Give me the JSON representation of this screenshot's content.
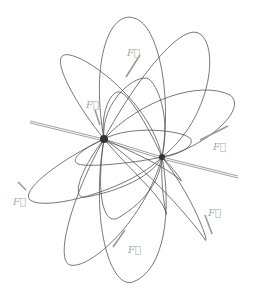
{
  "diagram": {
    "title": "",
    "colors": {
      "field_line": "#555555",
      "force_vector": "#9a9a9a",
      "label": "#aaaaaa",
      "charge": "#333333",
      "background": "#ffffff"
    },
    "charges": [
      {
        "id": "charge-1",
        "x": 104,
        "y": 139
      },
      {
        "id": "charge-2",
        "x": 162,
        "y": 157
      }
    ],
    "force_labels": [
      {
        "id": "force-top",
        "text": "F⃗",
        "x": 127,
        "y": 56
      },
      {
        "id": "force-upper-left",
        "text": "F⃗",
        "x": 86,
        "y": 108
      },
      {
        "id": "force-right",
        "text": "F⃗",
        "x": 213,
        "y": 150
      },
      {
        "id": "force-left",
        "text": "F⃗",
        "x": 13,
        "y": 205
      },
      {
        "id": "force-lower-right",
        "text": "F⃗",
        "x": 208,
        "y": 216
      },
      {
        "id": "force-bottom",
        "text": "F⃗",
        "x": 128,
        "y": 253
      }
    ]
  }
}
